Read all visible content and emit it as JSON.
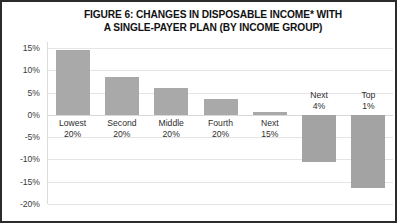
{
  "figure": {
    "title_line1": "FIGURE 6: CHANGES IN DISPOSABLE INCOME* WITH",
    "title_line2": "A SINGLE-PAYER PLAN (BY INCOME GROUP)",
    "bar_color": "#a9a9a9",
    "border_color": "#2b2b2b",
    "background": "#ffffff",
    "gridline_color": "#e4e4e4"
  },
  "chart_data": {
    "type": "bar",
    "title": "FIGURE 6: CHANGES IN DISPOSABLE INCOME* WITH A SINGLE-PAYER PLAN (BY INCOME GROUP)",
    "xlabel": "",
    "ylabel": "",
    "categories": [
      "Lowest 20%",
      "Second 20%",
      "Middle 20%",
      "Fourth 20%",
      "Next 15%",
      "Next 4%",
      "Top 1%"
    ],
    "category_lines": [
      [
        "Lowest",
        "20%"
      ],
      [
        "Second",
        "20%"
      ],
      [
        "Middle",
        "20%"
      ],
      [
        "Fourth",
        "20%"
      ],
      [
        "Next",
        "15%"
      ],
      [
        "Next",
        "4%"
      ],
      [
        "Top",
        "1%"
      ]
    ],
    "values": [
      14.5,
      8.5,
      6.0,
      3.5,
      0.7,
      -10.5,
      -16.5
    ],
    "ylim": [
      -20,
      16.4
    ],
    "yticks": [
      15,
      10,
      5,
      0,
      -5,
      -10,
      -15,
      -20
    ],
    "ytick_labels": [
      "15%",
      "10%",
      "5%",
      "0%",
      "-5%",
      "-10%",
      "-15%",
      "-20%"
    ],
    "grid": true,
    "legend": false
  }
}
